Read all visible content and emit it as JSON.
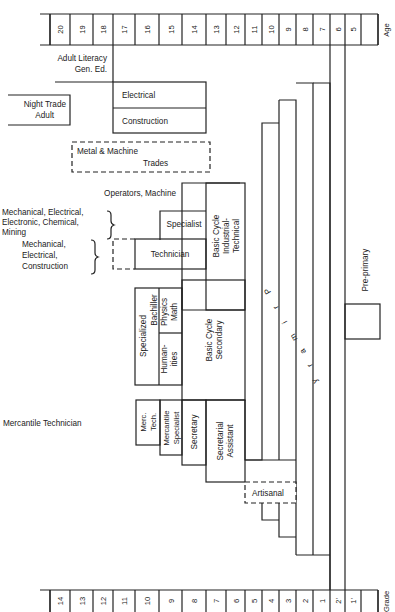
{
  "age_axis": {
    "label": "Age",
    "ticks": [
      "",
      "20",
      "19",
      "18",
      "17",
      "16",
      "15",
      "14",
      "13",
      "12",
      "11",
      "10",
      "9",
      "8",
      "7",
      "6",
      "5"
    ]
  },
  "grade_axis": {
    "label": "Grade",
    "ticks": [
      "",
      "14",
      "13",
      "12",
      "11",
      "10",
      "9",
      "8",
      "7",
      "6",
      "5",
      "4",
      "3",
      "2",
      "1",
      "2'",
      "1'"
    ]
  },
  "labels": {
    "adult_literacy_1": "Adult Literacy",
    "adult_literacy_2": "Gen. Ed.",
    "night_trade_1": "Night Trade",
    "night_trade_2": "Adult",
    "electrical": "Electrical",
    "construction": "Construction",
    "metal_machine_1": "Metal & Machine",
    "metal_machine_2": "Trades",
    "operators": "Operators, Machine",
    "specialist_fields_1": "Mechanical, Electrical,",
    "specialist_fields_2": "Electronic, Chemical,",
    "specialist_fields_3": "Mining",
    "technician_fields_1": "Mechanical,",
    "technician_fields_2": "Electrical,",
    "technician_fields_3": "Construction",
    "specialist": "Specialist",
    "technician": "Technician",
    "basic_industrial_1": "Basic Cycle",
    "basic_industrial_2": "Industrial-",
    "basic_industrial_3": "Technical",
    "specialized_bachiller_1": "Specialized",
    "specialized_bachiller_2": "Bachiller",
    "humanities_1": "Human-",
    "humanities_2": "ities",
    "physics_math_1": "Physics",
    "physics_math_2": "Math",
    "basic_secondary_1": "Basic Cycle",
    "basic_secondary_2": "Secondary",
    "mercantile_technician": "Mercantile  Technician",
    "merc_tech_1": "Merc.",
    "merc_tech_2": "Tech.",
    "mercantile_specialist_1": "Mercantile",
    "mercantile_specialist_2": "Specialist",
    "secretary": "Secretary",
    "secretarial_assistant_1": "Secretarial",
    "secretarial_assistant_2": "Assistant",
    "artisanal": "Artisanal",
    "primary": [
      "P",
      "r",
      "i",
      "m",
      "a",
      "r",
      "y"
    ],
    "pre_primary": "Pre-primary"
  }
}
